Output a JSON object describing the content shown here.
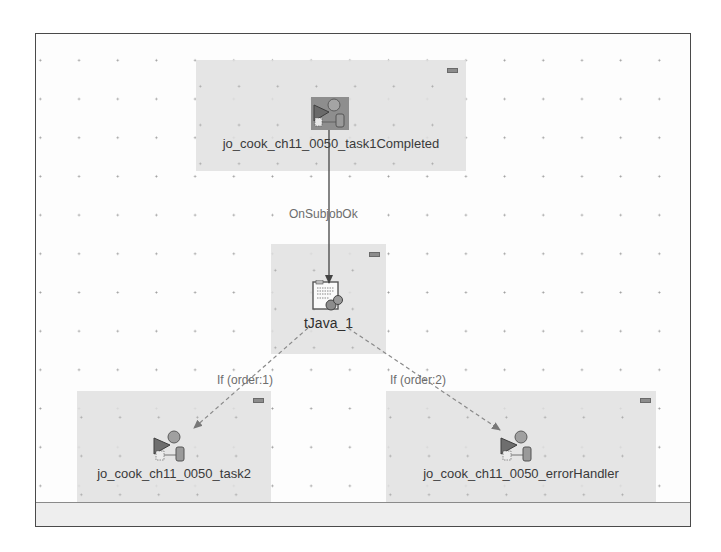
{
  "canvas": {
    "grid_color": "#9a9a9a",
    "background": "#fdfdfd"
  },
  "nodes": {
    "task1": {
      "label": "jo_cook_ch11_0050_task1Completed",
      "icon": "run-job-icon",
      "selected": true
    },
    "tjava": {
      "label": "tJava_1",
      "icon": "tjava-component-icon"
    },
    "task2": {
      "label": "jo_cook_ch11_0050_task2",
      "icon": "run-job-icon"
    },
    "error_handler": {
      "label": "jo_cook_ch11_0050_errorHandler",
      "icon": "run-job-icon"
    }
  },
  "connections": {
    "on_subjob_ok": {
      "label": "OnSubjobOk",
      "from": "task1",
      "to": "tjava",
      "style": "solid"
    },
    "if_order_1": {
      "label": "If (order:1)",
      "from": "tjava",
      "to": "task2",
      "style": "dashed"
    },
    "if_order_2": {
      "label": "If (order:2)",
      "from": "tjava",
      "to": "error_handler",
      "style": "dashed"
    }
  }
}
